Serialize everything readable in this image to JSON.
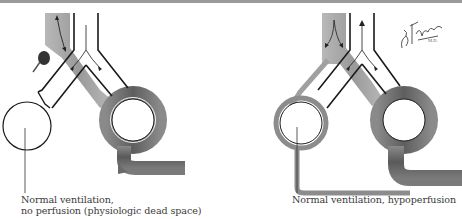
{
  "figure": {
    "panels": [
      {
        "id": "left",
        "caption_line1": "Normal ventilation,",
        "caption_line2": "no perfusion (physiologic dead space)",
        "elements": [
          "pulmonary-artery-with-embolus",
          "airway-bronchus",
          "unperfused-alveolus",
          "perfused-alveolus",
          "capillary"
        ]
      },
      {
        "id": "right",
        "caption_line1": "Normal ventilation, hypoperfusion",
        "elements": [
          "pulmonary-artery",
          "airway-bronchus",
          "hypoperfused-alveolus",
          "perfused-alveolus",
          "capillary"
        ]
      }
    ],
    "signature": "F. Netter M.D."
  },
  "colors": {
    "vessel": "#6e6e6e",
    "vessel_light": "#a8a8a8",
    "airway_outline": "#1a1a1a",
    "background": "#ffffff",
    "caption": "#3a3a3a"
  }
}
